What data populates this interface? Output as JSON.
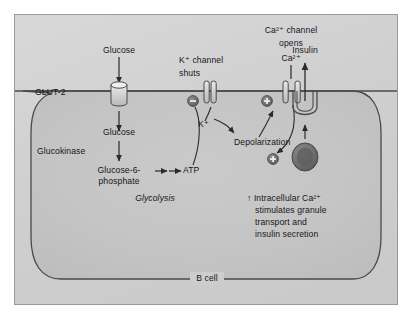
{
  "figure": {
    "background_color": "#d2d2d2",
    "border_color": "#9a9a9a",
    "line_color": "#3a3a3a",
    "text_color": "#15161a",
    "width": 412,
    "height": 323
  },
  "cell": {
    "label": "B cell",
    "interior_color": "#c6c6c6",
    "membrane_color": "#3f3f3f"
  },
  "labels": {
    "glucose_extracellular": "Glucose",
    "glut2": "GLUT-2",
    "glucose_intracellular": "Glucose",
    "glucokinase": "Glucokinase",
    "glucose6phosphate_line1": "Glucose-6-",
    "glucose6phosphate_line2": "phosphate",
    "atp": "ATP",
    "glycolysis": "Glycolysis",
    "k_channel_line1": "K⁺ channel",
    "k_channel_line2": "shuts",
    "k_ion": "K⁺",
    "depolarization": "Depolarization",
    "ca_channel_line1": "Ca²⁺ channel",
    "ca_channel_line2": "opens",
    "ca_ion": "Ca²⁺",
    "insulin": "Insulin",
    "granule_note_line1": "↑ Intracellular Ca²⁺",
    "granule_note_line2": "stimulates granule",
    "granule_note_line3": "transport and",
    "granule_note_line4": "insulin secretion"
  },
  "symbols": {
    "inhibition": "–",
    "activation_ca_channel": "+",
    "activation_granule": "+"
  },
  "icons": {
    "glut2_transporter": "cylinder-transporter-icon",
    "k_channel": "ion-channel-icon",
    "ca_channel": "ion-channel-icon",
    "granule": "secretory-granule-icon",
    "exocytosis_pore": "exocytosis-pore-icon",
    "minus_badge": "minus-circle-icon",
    "plus_badge": "plus-circle-icon"
  }
}
